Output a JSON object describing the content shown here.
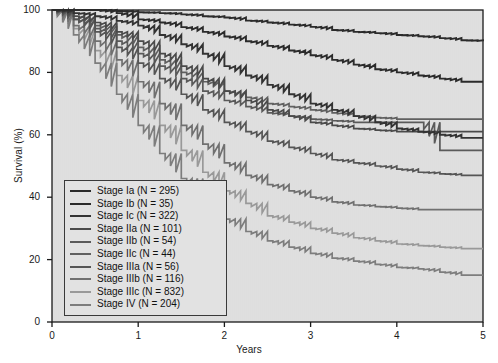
{
  "chart_data": {
    "type": "line",
    "title": "",
    "subtitle": "",
    "xlabel": "Years",
    "ylabel": "Survival (%)",
    "xlim": [
      0,
      5
    ],
    "ylim": [
      0,
      100
    ],
    "xticks": [
      0,
      1,
      2,
      3,
      4,
      5
    ],
    "yticks": [
      0,
      20,
      40,
      60,
      80,
      100
    ],
    "xtick_labels": [
      "0",
      "1",
      "2",
      "3",
      "4",
      "5"
    ],
    "ytick_labels": [
      "0",
      "20",
      "40",
      "60",
      "80",
      "100"
    ],
    "grid": false,
    "legend_position": "lower-left-inside",
    "plot_background": "#e2e2e2",
    "axis_color": "#1a1a1a",
    "curve_style": "step",
    "x": [
      0,
      0.25,
      0.5,
      0.75,
      1,
      1.25,
      1.5,
      1.75,
      2,
      2.25,
      2.5,
      2.75,
      3,
      3.25,
      3.5,
      3.75,
      4,
      4.25,
      4.5,
      4.75,
      5
    ],
    "series": [
      {
        "name": "Stage Ia",
        "label": "Stage Ia (N = 295)",
        "n": 295,
        "color": "#2b2b2b",
        "width": 1.9,
        "values": [
          100,
          100,
          100,
          99.7,
          99.3,
          99,
          98.6,
          98,
          97.6,
          96.6,
          96,
          95.3,
          94.6,
          93.6,
          93,
          92.6,
          92,
          91.6,
          91,
          90.3,
          90
        ]
      },
      {
        "name": "Stage Ib",
        "label": "Stage Ib (N = 35)",
        "n": 35,
        "color": "#2b2b2b",
        "width": 1.9,
        "values": [
          100,
          100,
          100,
          99,
          97,
          96,
          94.5,
          93,
          91.5,
          90,
          88.5,
          87,
          85.5,
          84,
          82.5,
          81,
          80,
          79,
          78,
          77,
          77
        ]
      },
      {
        "name": "Stage Ic",
        "label": "Stage Ic (N = 322)",
        "n": 322,
        "color": "#333333",
        "width": 1.9,
        "values": [
          100,
          99,
          98,
          96.5,
          95,
          92,
          89,
          86,
          82,
          79,
          76,
          73,
          70,
          68,
          66,
          64,
          62,
          61,
          60,
          59,
          59
        ]
      },
      {
        "name": "Stage IIa",
        "label": "Stage IIa (N = 101)",
        "n": 101,
        "color": "#4a4a4a",
        "width": 1.7,
        "values": [
          100,
          98,
          96,
          93,
          90,
          86,
          82,
          78,
          74,
          71,
          68,
          66,
          64,
          63,
          62,
          61.5,
          61,
          61,
          61,
          61,
          61
        ]
      },
      {
        "name": "Stage IIb",
        "label": "Stage IIb (N = 54)",
        "n": 54,
        "color": "#5a5a5a",
        "width": 1.7,
        "values": [
          100,
          97,
          94,
          90,
          86,
          82,
          78,
          74,
          71,
          69,
          67,
          66,
          65,
          64.5,
          64,
          64,
          64,
          64,
          55,
          55,
          55
        ]
      },
      {
        "name": "Stage IIc",
        "label": "Stage IIc (N = 44)",
        "n": 44,
        "color": "#606060",
        "width": 1.7,
        "values": [
          100,
          98,
          95,
          92,
          88,
          84,
          80,
          77,
          74,
          72,
          70,
          69,
          68,
          67,
          66,
          65.5,
          65,
          65,
          65,
          65,
          65
        ]
      },
      {
        "name": "Stage IIIa",
        "label": "Stage IIIa (N = 56)",
        "n": 56,
        "color": "#555555",
        "width": 1.7,
        "values": [
          100,
          97,
          93,
          88,
          83,
          78,
          73,
          68,
          64,
          61,
          58,
          56,
          54,
          52,
          51,
          50,
          49,
          48,
          47.5,
          47,
          47
        ]
      },
      {
        "name": "Stage IIIb",
        "label": "Stage IIIb (N = 116)",
        "n": 116,
        "color": "#707070",
        "width": 1.7,
        "values": [
          100,
          95,
          90,
          84,
          77,
          70,
          63,
          57,
          51,
          47,
          44,
          42,
          40,
          38.5,
          37.5,
          37,
          36.5,
          36,
          36,
          36,
          36
        ]
      },
      {
        "name": "Stage IIIc",
        "label": "Stage IIIc (N = 832)",
        "n": 832,
        "color": "#999999",
        "width": 1.7,
        "values": [
          100,
          94,
          87,
          79,
          71,
          63,
          55,
          48,
          42,
          38,
          34,
          32,
          30,
          28.5,
          27,
          26,
          25,
          24.5,
          24,
          23.5,
          23.5
        ]
      },
      {
        "name": "Stage IV",
        "label": "Stage IV (N = 204)",
        "n": 204,
        "color": "#7d7d7d",
        "width": 1.7,
        "values": [
          100,
          92,
          83,
          73,
          63,
          54,
          46,
          39,
          33,
          29,
          26,
          24,
          22,
          20.5,
          19.5,
          18.5,
          17.5,
          17,
          16,
          15,
          15
        ]
      }
    ]
  },
  "axes": {
    "ylabel": "Survival (%)",
    "xlabel": "Years"
  }
}
